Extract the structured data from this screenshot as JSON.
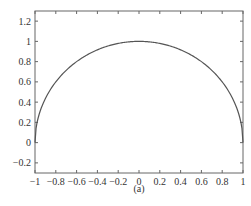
{
  "chart_data": {
    "type": "line",
    "title": "",
    "caption": "(a)",
    "xlabel": "",
    "ylabel": "",
    "xlim": [
      -1,
      1
    ],
    "ylim": [
      -0.3,
      1.3
    ],
    "grid": false,
    "legend": null,
    "x_ticks": [
      "-1",
      "-0.8",
      "-0.6",
      "-0.4",
      "-0.2",
      "0",
      "0.2",
      "0.4",
      "0.6",
      "0.8",
      "1"
    ],
    "x_tick_values": [
      -1,
      -0.8,
      -0.6,
      -0.4,
      -0.2,
      0,
      0.2,
      0.4,
      0.6,
      0.8,
      1
    ],
    "y_ticks": [
      "1.2",
      "1",
      "0.8",
      "0.6",
      "0.4",
      "0.2",
      "0",
      "-0.2"
    ],
    "y_tick_values": [
      1.2,
      1,
      0.8,
      0.6,
      0.4,
      0.2,
      0,
      -0.2
    ],
    "series": [
      {
        "name": "semicircle y = sqrt(1 - x^2)",
        "x": [
          -1,
          -0.99,
          -0.95,
          -0.9,
          -0.8,
          -0.7,
          -0.6,
          -0.5,
          -0.4,
          -0.3,
          -0.2,
          -0.1,
          0,
          0.1,
          0.2,
          0.3,
          0.4,
          0.5,
          0.6,
          0.7,
          0.8,
          0.9,
          0.95,
          0.99,
          1
        ],
        "values": [
          0,
          0.141,
          0.312,
          0.436,
          0.6,
          0.714,
          0.8,
          0.866,
          0.917,
          0.954,
          0.98,
          0.995,
          1,
          0.995,
          0.98,
          0.954,
          0.917,
          0.866,
          0.8,
          0.714,
          0.6,
          0.436,
          0.312,
          0.141,
          0
        ],
        "color": "#555555"
      }
    ]
  },
  "colors": {
    "axis": "#666666",
    "curve": "#555555",
    "text": "#333333"
  }
}
